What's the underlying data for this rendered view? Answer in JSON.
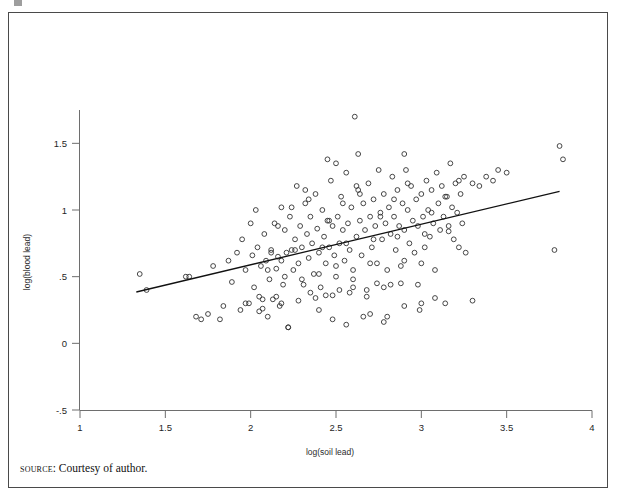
{
  "figure": {
    "source_prefix": "source",
    "source_text": ": Courtesy of author.",
    "frame_color": "#4a4a4a"
  },
  "chart_data": {
    "type": "scatter",
    "title": "",
    "subtitle": "",
    "xlabel": "log(soil lead)",
    "ylabel": "log(blood lead)",
    "xlim": [
      1,
      4
    ],
    "ylim": [
      -0.5,
      1.75
    ],
    "xticks": [
      1,
      1.5,
      2,
      2.5,
      3,
      3.5,
      4
    ],
    "xticklabels": [
      "1",
      "1.5",
      "2",
      "2.5",
      "3",
      "3.5",
      "4"
    ],
    "yticks": [
      -0.5,
      0,
      0.5,
      1,
      1.5
    ],
    "yticklabels": [
      "-.5",
      "0",
      ".5",
      "1",
      "1.5"
    ],
    "grid": false,
    "legend": null,
    "marker": "open-circle",
    "marker_color": "#333333",
    "fit_line": {
      "label": "linear fit",
      "color": "#111111",
      "x_start": 1.33,
      "y_start": 0.385,
      "x_end": 3.81,
      "y_end": 1.14,
      "slope": 0.304,
      "intercept": -0.02
    },
    "x": [
      1.35,
      1.39,
      1.62,
      1.64,
      1.68,
      1.71,
      1.75,
      1.78,
      1.82,
      1.84,
      1.87,
      1.89,
      1.92,
      1.94,
      1.95,
      1.97,
      1.99,
      2.0,
      2.01,
      2.02,
      2.03,
      2.04,
      2.05,
      2.06,
      2.07,
      2.08,
      2.09,
      2.1,
      2.11,
      2.12,
      2.13,
      2.14,
      2.15,
      2.16,
      2.17,
      2.18,
      2.18,
      2.19,
      2.2,
      2.21,
      2.22,
      2.23,
      2.24,
      2.25,
      2.26,
      2.27,
      2.28,
      2.29,
      2.3,
      2.31,
      2.32,
      2.33,
      2.34,
      2.35,
      2.36,
      2.37,
      2.38,
      2.39,
      2.4,
      2.41,
      2.42,
      2.43,
      2.44,
      2.45,
      2.46,
      2.47,
      2.48,
      2.49,
      2.5,
      2.5,
      2.51,
      2.52,
      2.53,
      2.54,
      2.55,
      2.56,
      2.57,
      2.58,
      2.59,
      2.6,
      2.61,
      2.62,
      2.63,
      2.64,
      2.65,
      2.66,
      2.67,
      2.68,
      2.69,
      2.7,
      2.71,
      2.72,
      2.73,
      2.74,
      2.75,
      2.76,
      2.77,
      2.78,
      2.79,
      2.8,
      2.81,
      2.82,
      2.83,
      2.84,
      2.85,
      2.86,
      2.87,
      2.88,
      2.89,
      2.9,
      2.91,
      2.92,
      2.93,
      2.94,
      2.95,
      2.96,
      2.97,
      2.98,
      2.99,
      3.0,
      3.01,
      3.02,
      3.03,
      3.04,
      3.05,
      3.06,
      3.07,
      3.08,
      3.09,
      3.1,
      3.11,
      3.12,
      3.13,
      3.14,
      3.15,
      3.16,
      3.17,
      3.18,
      3.19,
      3.2,
      3.21,
      3.22,
      3.23,
      3.24,
      3.25,
      3.26,
      3.3,
      3.34,
      3.38,
      3.42,
      3.45,
      3.5,
      3.78,
      3.81,
      3.83,
      2.63,
      2.45,
      2.9,
      1.97,
      2.07,
      2.15,
      2.22,
      2.35,
      2.44,
      2.52,
      2.6,
      2.66,
      2.74,
      2.82,
      2.9,
      2.1,
      2.2,
      2.3,
      2.4,
      2.5,
      2.6,
      2.7,
      2.8,
      2.9,
      3.0,
      2.05,
      2.18,
      2.28,
      2.38,
      2.48,
      2.58,
      2.68,
      2.78,
      2.88,
      2.98,
      2.12,
      2.26,
      2.42,
      2.56,
      2.72,
      2.86,
      3.02,
      3.16,
      2.34,
      2.64,
      2.16,
      2.46,
      2.76,
      3.06,
      2.24,
      2.54,
      2.84,
      3.14,
      2.32,
      2.62,
      2.92,
      3.22,
      2.4,
      2.7,
      3.0,
      3.3,
      2.48,
      2.78,
      3.08,
      2.56
    ],
    "y": [
      0.52,
      0.4,
      0.5,
      0.5,
      0.2,
      0.18,
      0.22,
      0.58,
      0.18,
      0.28,
      0.62,
      0.46,
      0.68,
      0.25,
      0.78,
      0.55,
      0.3,
      0.9,
      0.66,
      0.42,
      1.0,
      0.72,
      0.35,
      0.58,
      0.26,
      0.82,
      0.62,
      0.2,
      0.48,
      0.7,
      0.33,
      0.9,
      0.56,
      0.65,
      0.28,
      1.02,
      0.62,
      0.44,
      0.85,
      0.68,
      0.12,
      0.95,
      0.7,
      0.55,
      0.78,
      1.18,
      0.6,
      0.88,
      0.72,
      0.44,
      1.05,
      0.82,
      0.64,
      0.95,
      0.75,
      0.52,
      1.12,
      0.86,
      0.68,
      0.42,
      1.0,
      0.8,
      0.6,
      0.92,
      0.72,
      1.22,
      0.88,
      0.66,
      1.35,
      0.5,
      0.95,
      0.75,
      1.1,
      0.85,
      0.62,
      1.28,
      0.9,
      0.7,
      1.02,
      0.48,
      1.7,
      0.8,
      1.15,
      0.92,
      0.66,
      1.05,
      0.85,
      0.35,
      1.2,
      0.95,
      0.72,
      1.08,
      0.88,
      0.6,
      1.3,
      0.98,
      0.78,
      1.12,
      0.9,
      0.2,
      1.02,
      0.82,
      1.25,
      0.95,
      0.7,
      1.15,
      0.88,
      0.58,
      1.05,
      0.85,
      1.3,
      1.0,
      0.75,
      1.18,
      0.92,
      0.68,
      1.08,
      0.88,
      0.25,
      1.12,
      0.95,
      0.72,
      1.22,
      1.0,
      0.8,
      1.15,
      0.9,
      0.55,
      1.28,
      1.05,
      0.85,
      1.18,
      0.95,
      0.3,
      1.1,
      0.88,
      1.35,
      1.02,
      0.78,
      1.2,
      0.98,
      0.72,
      1.12,
      0.9,
      1.25,
      0.68,
      1.2,
      1.18,
      1.25,
      1.22,
      1.3,
      1.28,
      0.7,
      1.48,
      1.38,
      1.42,
      1.38,
      1.42,
      0.3,
      0.33,
      0.35,
      0.12,
      0.38,
      0.36,
      0.4,
      0.42,
      0.2,
      0.45,
      0.44,
      0.28,
      0.55,
      0.5,
      0.48,
      0.52,
      0.58,
      0.55,
      0.6,
      0.55,
      0.62,
      0.6,
      0.24,
      0.3,
      0.32,
      0.34,
      0.36,
      0.38,
      0.4,
      0.42,
      0.45,
      0.44,
      0.68,
      0.7,
      0.72,
      0.75,
      0.78,
      0.8,
      0.82,
      0.84,
      1.08,
      1.12,
      0.88,
      0.92,
      0.95,
      0.98,
      1.02,
      1.05,
      1.08,
      1.1,
      1.15,
      1.18,
      1.2,
      1.22,
      0.25,
      0.22,
      0.3,
      0.32,
      0.18,
      0.16,
      0.34,
      0.14
    ]
  }
}
